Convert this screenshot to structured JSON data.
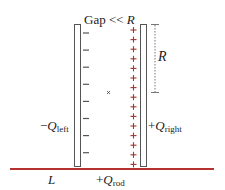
{
  "diagram": {
    "gap_label": {
      "prefix": "Gap << ",
      "var": "R"
    },
    "r_label": "R",
    "left_plate": {
      "label_sign": "−",
      "label_var": "Q",
      "label_sub": "left",
      "charge_sign": "−",
      "charge_count": 8
    },
    "right_plate": {
      "label_sign": "+",
      "label_var": "Q",
      "label_sub": "right",
      "charge_sign": "+",
      "charge_count": 15
    },
    "center_marker": "×",
    "rod": {
      "length_label": "L",
      "label_sign": "+",
      "label_var": "Q",
      "label_sub": "rod"
    },
    "colors": {
      "plate_stroke": "#555555",
      "plus_charge": "#a0362f",
      "minus_charge": "#555555",
      "rod": "#b5312f",
      "text": "#222222",
      "dimension": "#777777"
    }
  }
}
